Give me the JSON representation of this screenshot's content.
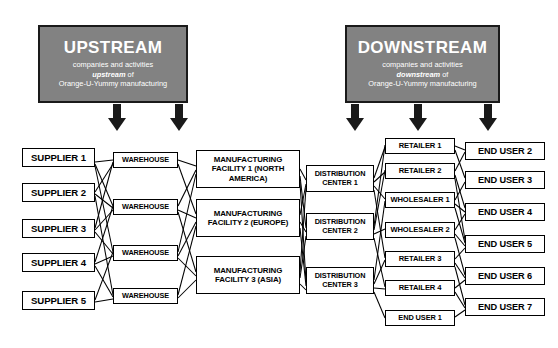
{
  "diagram": {
    "colors": {
      "header_fill": "#828282",
      "header_text": "#ffffff",
      "node_fill": "#ffffff",
      "line": "#000000",
      "background": "#ffffff"
    },
    "headers": [
      {
        "id": "upstream",
        "title": "UPSTREAM",
        "line1": "companies and activities",
        "line2_em": "upstream",
        "line2_tail": " of",
        "line3": "Orange-U-Yummy manufacturing",
        "arrows": 2
      },
      {
        "id": "downstream",
        "title": "DOWNSTREAM",
        "line1": "companies and activities",
        "line2_em": "downstream",
        "line2_tail": " of",
        "line3": "Orange-U-Yummy manufacturing",
        "arrows": 3
      }
    ],
    "columns": [
      {
        "id": "suppliers",
        "name": "Suppliers",
        "nodes": [
          "SUPPLIER 1",
          "SUPPLIER 2",
          "SUPPLIER 3",
          "SUPPLIER 4",
          "SUPPLIER 5"
        ]
      },
      {
        "id": "warehouses",
        "name": "Warehouses",
        "nodes": [
          "WAREHOUSE",
          "WAREHOUSE",
          "WAREHOUSE",
          "WAREHOUSE"
        ]
      },
      {
        "id": "manufacturing",
        "name": "Manufacturing facilities",
        "nodes": [
          "MANUFACTURING FACILITY 1 (NORTH AMERICA)",
          "MANUFACTURING FACILITY 2 (EUROPE)",
          "MANUFACTURING FACILITY 3 (ASIA)"
        ]
      },
      {
        "id": "distribution",
        "name": "Distribution centers",
        "nodes": [
          "DISTRIBUTION CENTER 1",
          "DISTRIBUTION CENTER 2",
          "DISTRIBUTION CENTER 3"
        ]
      },
      {
        "id": "resellers",
        "name": "Retailers and wholesalers",
        "nodes": [
          "RETAILER 1",
          "RETAILER 2",
          "WHOLESALER 1",
          "WHOLESALER 2",
          "RETAILER 3",
          "RETAILER 4",
          "END USER 1"
        ]
      },
      {
        "id": "endusers",
        "name": "End users",
        "nodes": [
          "END USER 2",
          "END USER 3",
          "END USER 4",
          "END USER 5",
          "END USER 6",
          "END USER 7"
        ]
      }
    ]
  }
}
